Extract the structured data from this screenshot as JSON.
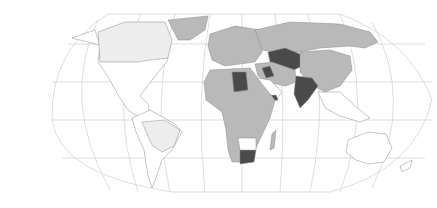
{
  "map": {
    "projection": "Robinson-like world map",
    "legend_categories": [
      {
        "key": "none",
        "color": "#ffffff"
      },
      {
        "key": "light",
        "color": "#ededed"
      },
      {
        "key": "mid",
        "color": "#b9b9b9"
      },
      {
        "key": "dark",
        "color": "#4a4a4a"
      }
    ],
    "regions": [
      {
        "name": "North America",
        "shade": "none"
      },
      {
        "name": "Canada",
        "shade": "light"
      },
      {
        "name": "Greenland",
        "shade": "mid"
      },
      {
        "name": "South America",
        "shade": "none"
      },
      {
        "name": "Brazil",
        "shade": "light"
      },
      {
        "name": "Europe",
        "shade": "mid"
      },
      {
        "name": "Russia",
        "shade": "mid"
      },
      {
        "name": "Kazakhstan / Central Asia",
        "shade": "dark"
      },
      {
        "name": "China",
        "shade": "mid"
      },
      {
        "name": "India",
        "shade": "dark"
      },
      {
        "name": "Libya",
        "shade": "dark"
      },
      {
        "name": "Iraq",
        "shade": "dark"
      },
      {
        "name": "Yemen",
        "shade": "dark"
      },
      {
        "name": "Arabian Peninsula",
        "shade": "none"
      },
      {
        "name": "Africa",
        "shade": "mid"
      },
      {
        "name": "South Africa",
        "shade": "dark"
      },
      {
        "name": "Madagascar",
        "shade": "mid"
      },
      {
        "name": "Southeast Asia",
        "shade": "none"
      },
      {
        "name": "Australia",
        "shade": "none"
      },
      {
        "name": "New Zealand",
        "shade": "none"
      }
    ]
  }
}
